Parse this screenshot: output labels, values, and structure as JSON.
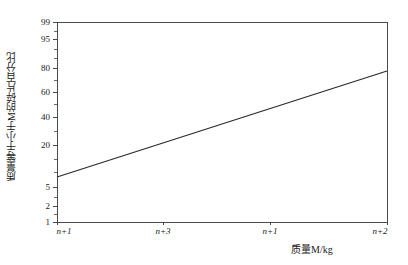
{
  "chart_data": {
    "type": "line",
    "title": "",
    "subtitle": "",
    "xlabel": "质量M/kg",
    "ylabel": "质量等于小于M的碎片百分比",
    "x_scale": "log",
    "y_scale": "probability",
    "grid": false,
    "legend": false,
    "legend_position": "none",
    "x_ticks": [
      {
        "label": "n+1",
        "pos_px": 57
      },
      {
        "label": "n+3",
        "pos_px": 163
      },
      {
        "label": "n+1",
        "pos_px": 270
      },
      {
        "label": "n+2",
        "pos_px": 387
      }
    ],
    "y_ticks_major": [
      {
        "label": "99",
        "value": 99,
        "pos_px": 22
      },
      {
        "label": "95",
        "value": 95,
        "pos_px": 39
      },
      {
        "label": "80",
        "value": 80,
        "pos_px": 68
      },
      {
        "label": "60",
        "value": 60,
        "pos_px": 92
      },
      {
        "label": "40",
        "value": 40,
        "pos_px": 117
      },
      {
        "label": "20",
        "value": 20,
        "pos_px": 145
      },
      {
        "label": "5",
        "value": 5,
        "pos_px": 187
      },
      {
        "label": "2",
        "value": 2,
        "pos_px": 206
      },
      {
        "label": "1",
        "value": 1,
        "pos_px": 222
      }
    ],
    "y_ticks_minor_px": [
      31,
      49,
      58,
      80,
      104,
      131,
      159,
      172,
      197,
      214
    ],
    "ylim": [
      1,
      99
    ],
    "series": [
      {
        "name": "累积质量分布",
        "color": "#2b2b2b",
        "points": [
          {
            "x_px": 57,
            "y_px": 177,
            "x_label": "n+1",
            "y_value": 11
          },
          {
            "x_px": 387,
            "y_px": 71,
            "x_label": "n+2",
            "y_value": 85
          }
        ]
      }
    ],
    "annotations": []
  },
  "figure": {
    "plot_left_px": 57,
    "plot_right_px": 387,
    "plot_top_px": 22,
    "plot_bottom_px": 222,
    "background_color": "#ffffff",
    "axis_color": "#4a4a4a"
  }
}
